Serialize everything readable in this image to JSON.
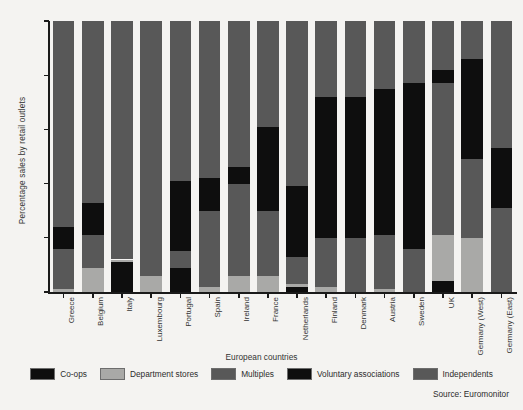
{
  "chart_data": {
    "type": "bar",
    "subtype": "stacked-bar-100",
    "title": "",
    "xlabel": "European countries",
    "ylabel": "Percentage sales by retail outlets",
    "ylim": [
      0,
      100
    ],
    "yticks": [
      0,
      20,
      40,
      60,
      80,
      100
    ],
    "grid": false,
    "legend_position": "bottom",
    "source": "Source: Euromonitor",
    "categories": [
      "Greece",
      "Belgium",
      "Italy",
      "Luxembourg",
      "Portugal",
      "Spain",
      "Ireland",
      "France",
      "Netherlands",
      "Finland",
      "Denmark",
      "Austria",
      "Sweden",
      "UK",
      "Germany (West)",
      "Germany (East)"
    ],
    "series": [
      {
        "name": "Co-ops",
        "color": "#0e0e0e",
        "values": [
          0,
          0,
          11,
          0,
          9,
          0,
          0,
          0,
          2,
          0,
          0,
          0,
          0,
          4,
          0,
          0
        ]
      },
      {
        "name": "Department stores",
        "color": "#a9a9a7",
        "values": [
          1,
          9,
          1,
          6,
          0,
          2,
          6,
          6,
          1,
          2,
          0,
          1,
          0,
          17,
          20,
          0
        ]
      },
      {
        "name": "Multiples",
        "color": "#585858",
        "values": [
          15,
          12,
          21,
          29,
          6,
          28,
          34,
          24,
          10,
          18,
          20,
          20,
          16,
          56,
          29,
          31
        ]
      },
      {
        "name": "Voluntary associations",
        "color": "#0e0e0e",
        "values": [
          8,
          12,
          0,
          0,
          26,
          12,
          6,
          31,
          26,
          52,
          52,
          54,
          61,
          5,
          37,
          22
        ]
      },
      {
        "name": "Independents",
        "color": "#585858",
        "values": [
          76,
          67,
          67,
          65,
          59,
          58,
          54,
          39,
          61,
          28,
          28,
          25,
          23,
          18,
          14,
          47
        ]
      }
    ]
  },
  "legend": {
    "items": [
      {
        "label": "Co-ops",
        "color": "#0e0e0e"
      },
      {
        "label": "Department stores",
        "color": "#a9a9a7"
      },
      {
        "label": "Multiples",
        "color": "#585858"
      },
      {
        "label": "Voluntary associations",
        "color": "#0e0e0e"
      },
      {
        "label": "Independents",
        "color": "#585858"
      }
    ]
  }
}
